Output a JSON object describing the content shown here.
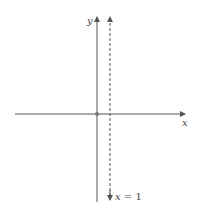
{
  "diagram": {
    "type": "coordinate-plane",
    "axes": {
      "x_label": "x",
      "y_label": "y"
    },
    "origin_marker": true,
    "asymptote": {
      "style": "dashed",
      "label_var": "x",
      "label_eq": " = 1",
      "value": 1
    },
    "colors": {
      "axis": "#555555",
      "dashed": "#555555",
      "text": "#444444"
    }
  }
}
